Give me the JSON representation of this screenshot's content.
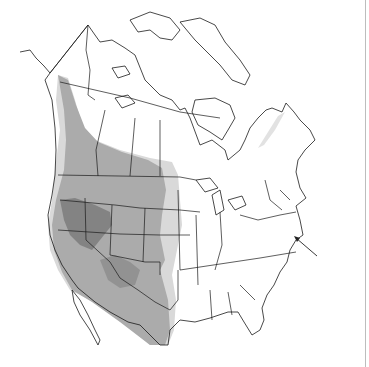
{
  "map": {
    "title": "",
    "region": "North America",
    "legend": [],
    "shading": {
      "light": "#d9d9d9",
      "medium": "#ababab",
      "dark": "#838383"
    },
    "outline_color": "#1a1a1a",
    "background": "#ffffff",
    "annotation": {
      "type": "arrow",
      "points_to": "Northeast US coast (New England / New Jersey)",
      "from": [
        317,
        256
      ],
      "to": [
        295,
        237
      ]
    }
  }
}
